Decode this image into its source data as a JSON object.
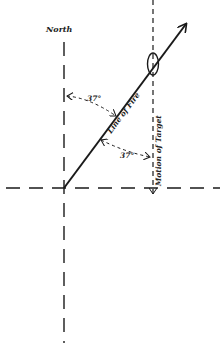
{
  "diagram": {
    "labels": {
      "north": "North",
      "angle_top": "37°",
      "angle_bottom": "37°",
      "line_of_fire": "Line of Fire",
      "motion_of_target": "Motion of Target"
    },
    "colors": {
      "ink": "#1a1a1a",
      "background": "#ffffff"
    },
    "geometry": {
      "origin": [
        64,
        188
      ],
      "line_of_fire_end": [
        186,
        24
      ],
      "target_line_x": 153,
      "north_axis_top": 42,
      "horizontal_axis_y": 188
    }
  }
}
